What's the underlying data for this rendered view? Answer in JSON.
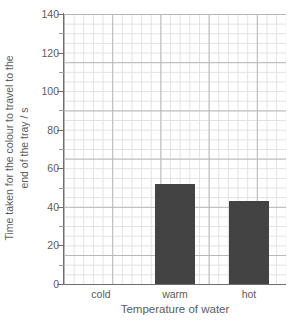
{
  "chart_data": {
    "type": "bar",
    "title": "",
    "subtitle": "",
    "categories": [
      "cold",
      "warm",
      "hot"
    ],
    "values": [
      0,
      52,
      43
    ],
    "xlabel": "Temperature of water",
    "ylabel": "Time taken for the colour to travel to the end of the tray / s",
    "ylabel_line1": "Time taken for the colour to travel to the",
    "ylabel_line2": "end of the tray / s",
    "ylim": [
      0,
      140
    ],
    "ytick_step": 20,
    "yticks": [
      0,
      20,
      40,
      60,
      80,
      100,
      120,
      140
    ],
    "ytick_labels": [
      "0",
      "20",
      "40",
      "60",
      "80",
      "100",
      "120",
      "140"
    ],
    "grid": true,
    "grid_minor_step": 5,
    "legend": "none",
    "bar_color": "#434343",
    "grid_major_color": "#b8b8b8",
    "grid_minor_color": "#e2e2e2",
    "axis_color": "#6e6e6e",
    "text_color": "#5c5c5c",
    "background": "#ffffff"
  }
}
